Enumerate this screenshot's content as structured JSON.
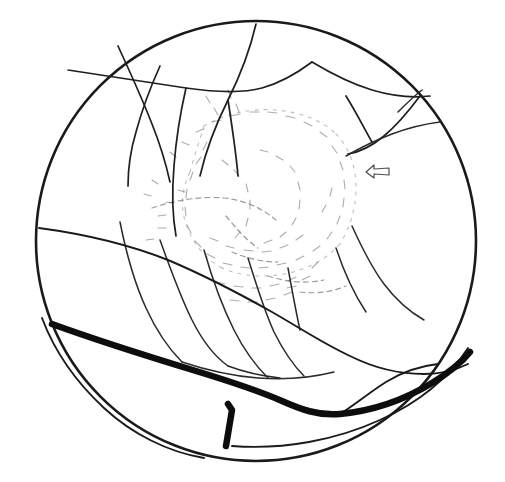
{
  "figure": {
    "type": "line-drawing",
    "background_color": "#ffffff",
    "ink_color": "#1a1a1a",
    "faint_ink_color": "#8c8c8c",
    "mid_ink_color": "#4d4d4d",
    "canvas": {
      "width": 505,
      "height": 482
    }
  },
  "field": {
    "label": "fundus field boundary",
    "shape": "circle",
    "cx": 256,
    "cy": 241,
    "r": 220,
    "stroke_width": 2.6,
    "color": "#1a1a1a"
  },
  "marker": {
    "label": "arrow marker",
    "direction": "left",
    "x": 378,
    "y": 172,
    "color": "#4d4d4d",
    "stroke_width": 1.2
  },
  "legend": {
    "thick_band": "retinal break / detachment border",
    "thin_lines": "retinal vessels",
    "stipple": "pigmentary / exudative lesion area",
    "arrow": "point of interest"
  },
  "geometry": {
    "thick_band": {
      "color": "#0d0d0d",
      "stroke_width": 6.5,
      "segments": [
        "M 52 324 C 96 340 150 357 196 371 C 242 385 266 394 282 401 C 300 409 318 416 340 414 C 372 411 404 400 432 383 C 450 372 462 362 470 352",
        "M 228 404 L 232 410 L 226 446"
      ]
    },
    "demarcation_lines": {
      "color": "#1a1a1a",
      "stroke_width": 1.9,
      "segments": [
        "M 39 228 C 84 234 130 245 168 260 C 206 276 240 294 272 312 C 300 328 324 344 350 356 C 374 368 400 374 424 374 C 440 374 456 370 468 364",
        "M 42 318 C 54 350 76 382 104 408 C 132 434 168 452 204 458",
        "M 232 446 C 284 450 336 440 380 420 C 420 402 450 376 468 348",
        "M 340 414 C 356 404 370 392 386 382 C 402 372 420 366 438 364"
      ]
    },
    "vessels_main": {
      "color": "#1f1f1f",
      "stroke_width": 1.7,
      "segments": [
        "M 68 70 C 108 76 148 82 186 88 C 214 92 240 94 262 88 C 280 83 296 74 312 62",
        "M 256 24 C 250 50 240 76 228 100 C 216 124 206 150 200 176",
        "M 186 88 C 180 114 176 140 174 166 C 172 190 172 214 176 236",
        "M 228 100 C 232 126 236 152 238 176",
        "M 118 46 C 130 72 142 98 152 124 C 160 144 166 164 170 182",
        "M 160 66 C 150 88 142 110 136 132 C 130 152 128 170 128 186",
        "M 312 62 C 332 74 352 84 372 90 C 392 96 412 98 430 96",
        "M 346 96 C 356 112 364 128 372 142",
        "M 420 96 C 408 112 396 126 384 136 C 372 146 360 152 348 154"
      ]
    },
    "vessels_lower": {
      "color": "#2a2a2a",
      "stroke_width": 1.5,
      "segments": [
        "M 120 222 C 126 252 134 282 146 308 C 156 330 168 348 182 362",
        "M 160 240 C 170 268 180 296 192 320 C 202 340 214 356 228 366",
        "M 204 250 C 212 278 222 306 234 330 C 244 350 256 366 268 378",
        "M 248 258 C 256 284 264 310 274 332 C 284 352 294 366 304 376",
        "M 288 268 C 292 290 296 312 300 330",
        "M 182 362 C 206 370 232 376 258 378 C 284 380 310 378 334 372",
        "M 228 366 C 244 372 262 376 280 378"
      ]
    },
    "vessels_right": {
      "color": "#2a2a2a",
      "stroke_width": 1.5,
      "segments": [
        "M 346 156 C 360 148 376 140 392 134 C 408 128 424 124 440 122",
        "M 352 226 C 362 248 372 268 384 284 C 396 300 410 312 424 320",
        "M 336 248 C 344 272 354 294 366 312",
        "M 398 112 C 406 104 414 96 422 90"
      ]
    },
    "stipple_clusters": {
      "color": "#8a8a8a",
      "stroke_width": 1.1,
      "ring_outer": [
        "M 204 126 C 224 114 250 108 276 110 C 300 112 322 120 336 134",
        "M 336 134 C 350 148 356 168 356 188 C 356 208 350 228 340 244",
        "M 340 244 C 326 260 306 270 284 274 C 262 278 240 276 222 268",
        "M 222 268 C 204 258 192 242 186 224 C 180 206 182 188 190 172",
        "M 190 172 C 194 156 200 140 204 126"
      ],
      "dashes": [
        "M 196 132 l 8 -3",
        "M 212 122 l 9 -2",
        "M 230 116 l 10 -2",
        "M 250 112 l 9 0",
        "M 268 112 l 9 1",
        "M 286 116 l 9 2",
        "M 304 122 l 8 4",
        "M 320 132 l 7 5",
        "M 332 146 l 5 7",
        "M 340 162 l 3 8",
        "M 344 180 l 1 9",
        "M 344 198 l -1 9",
        "M 340 216 l -3 8",
        "M 332 232 l -5 7",
        "M 320 246 l -7 5",
        "M 304 256 l -8 4",
        "M 286 263 l -9 2",
        "M 268 267 l -9 1",
        "M 250 268 l -9 -1",
        "M 232 265 l -9 -2",
        "M 215 258 l -8 -4",
        "M 201 247 l -6 -6",
        "M 191 233 l -4 -8",
        "M 186 216 l -1 -9",
        "M 186 198 l 1 -9",
        "M 190 180 l 3 -8",
        "M 196 164 l 5 -7",
        "M 203 150 l 4 -8",
        "M 178 190 l 7 2",
        "M 166 202 l 8 1",
        "M 158 216 l 8 -1",
        "M 152 180 l 6 4",
        "M 144 194 l 7 2",
        "M 222 160 l 6 5",
        "M 234 170 l 5 6",
        "M 246 184 l 2 8",
        "M 250 200 l 0 9",
        "M 248 218 l -2 8",
        "M 240 232 l -5 6",
        "M 260 150 l 8 2",
        "M 276 156 l 7 4",
        "M 290 166 l 5 6",
        "M 298 182 l 2 8",
        "M 300 200 l -1 9",
        "M 296 218 l -4 7",
        "M 286 232 l -6 5",
        "M 272 240 l -8 3",
        "M 210 238 l 8 3",
        "M 226 246 l 8 2",
        "M 244 250 l 9 1",
        "M 262 252 l 9 -1",
        "M 280 248 l 8 -3",
        "M 296 240 l 7 -5",
        "M 216 282 l 9 2",
        "M 234 286 l 9 1",
        "M 252 288 l 9 0",
        "M 270 286 l 9 -2",
        "M 288 281 l 8 -4",
        "M 230 300 l 9 1",
        "M 248 302 l 9 0",
        "M 266 300 l 9 -2",
        "M 284 295 l 8 -3",
        "M 170 152 l 6 5",
        "M 182 142 l 7 3",
        "M 206 96 l 4 7",
        "M 214 108 l 4 7",
        "M 228 90 l 3 8",
        "M 236 104 l 3 8",
        "M 318 262 l -6 6",
        "M 310 276 l -8 4",
        "M 296 286 l -9 2",
        "M 322 212 l 4 -7",
        "M 330 196 l 2 -8",
        "M 158 228 l 8 0",
        "M 146 240 l 8 -1"
      ]
    },
    "lesion_outline": {
      "color": "#5a5a5a",
      "stroke_width": 1.2,
      "segments": [
        "M 152 208 C 176 200 200 196 224 198 C 244 200 262 208 276 220",
        "M 226 216 C 236 228 246 240 258 248",
        "M 232 252 C 246 258 262 262 278 262",
        "M 268 276 C 286 282 306 284 324 280",
        "M 300 292 C 316 294 332 292 346 286"
      ]
    }
  }
}
